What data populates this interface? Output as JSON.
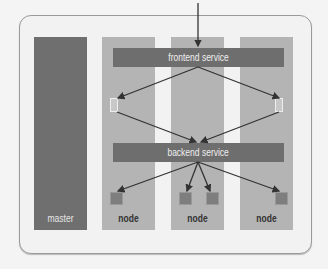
{
  "diagram": {
    "columns": [
      {
        "id": "master",
        "label": "master",
        "type": "master"
      },
      {
        "id": "node1",
        "label": "node",
        "type": "node"
      },
      {
        "id": "node2",
        "label": "node",
        "type": "node"
      },
      {
        "id": "node3",
        "label": "node",
        "type": "node"
      }
    ],
    "services": {
      "frontend": "frontend service",
      "backend": "backend service"
    },
    "colors": {
      "master": "#6f6f6f",
      "node": "#b4b4b4",
      "service_bar": "#6e6e6e",
      "pod": "#7e7e7e",
      "arrow": "#333333"
    },
    "edges": [
      {
        "from": "external",
        "to": "frontend service"
      },
      {
        "from": "frontend service",
        "to": "frontend pod (node1)"
      },
      {
        "from": "frontend service",
        "to": "frontend pod (node3)"
      },
      {
        "from": "frontend pod (node1)",
        "to": "backend service"
      },
      {
        "from": "frontend pod (node3)",
        "to": "backend service"
      },
      {
        "from": "backend service",
        "to": "backend pod (node1)"
      },
      {
        "from": "backend service",
        "to": "backend pod 1 (node2)"
      },
      {
        "from": "backend service",
        "to": "backend pod 2 (node2)"
      },
      {
        "from": "backend service",
        "to": "backend pod (node3)"
      }
    ]
  }
}
